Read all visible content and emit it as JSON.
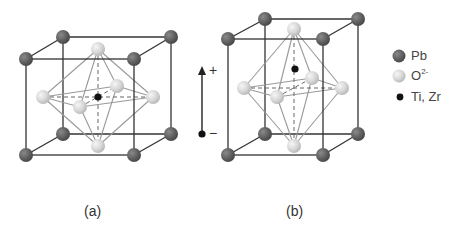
{
  "figure": {
    "panels": [
      {
        "id": "a",
        "caption": "(a)"
      },
      {
        "id": "b",
        "caption": "(b)"
      }
    ],
    "polarization_arrow": {
      "plus_label": "+",
      "minus_label": "−"
    },
    "legend": [
      {
        "label": "Pb",
        "superscript": "",
        "marker": "large-dark-gray-sphere"
      },
      {
        "label": "O",
        "superscript": "2-",
        "marker": "large-light-gray-sphere"
      },
      {
        "label": "Ti, Zr",
        "superscript": "",
        "marker": "small-black-dot"
      }
    ],
    "colors": {
      "pb_sphere": "#5f5f5f",
      "o_sphere": "#d4d4d4",
      "ti_dot": "#111111",
      "cube_edge": "#333333",
      "octa_edge": "#999999"
    }
  }
}
